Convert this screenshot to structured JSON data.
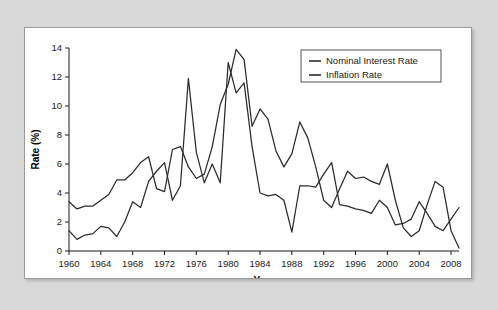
{
  "panel": {
    "background_color": "#ffffff",
    "border_color": "#9a9a9a",
    "page_background_color": "#d9d9d9"
  },
  "legend": {
    "position": "top-right",
    "items": [
      {
        "label": "Nominal Interest Rate",
        "color": "#2b2b2b"
      },
      {
        "label": "Inflation Rate",
        "color": "#2b2b2b"
      }
    ]
  },
  "axes": {
    "x_title": "Year",
    "y_title": "Rate (%)",
    "x_ticks": [
      "1960",
      "1964",
      "1968",
      "1972",
      "1976",
      "1980",
      "1984",
      "1988",
      "1992",
      "1996",
      "2000",
      "2004",
      "2008"
    ],
    "y_ticks": [
      "0",
      "2",
      "4",
      "6",
      "8",
      "10",
      "12",
      "14"
    ]
  },
  "chart_data": {
    "type": "line",
    "title": "",
    "subtitle": "",
    "xlabel": "Year",
    "ylabel": "Rate (%)",
    "xlim": [
      1960,
      2009
    ],
    "ylim": [
      0,
      14
    ],
    "grid": false,
    "legend_position": "top-right",
    "x_tick_step": 4,
    "y_tick_step": 2,
    "x": [
      1960,
      1961,
      1962,
      1963,
      1964,
      1965,
      1966,
      1967,
      1968,
      1969,
      1970,
      1971,
      1972,
      1973,
      1974,
      1975,
      1976,
      1977,
      1978,
      1979,
      1980,
      1981,
      1982,
      1983,
      1984,
      1985,
      1986,
      1987,
      1988,
      1989,
      1990,
      1991,
      1992,
      1993,
      1994,
      1995,
      1996,
      1997,
      1998,
      1999,
      2000,
      2001,
      2002,
      2003,
      2004,
      2005,
      2006,
      2007,
      2008,
      2009
    ],
    "series": [
      {
        "name": "Nominal Interest Rate",
        "color": "#2b2b2b",
        "values": [
          3.4,
          2.9,
          3.1,
          3.1,
          3.5,
          3.9,
          4.9,
          4.9,
          5.4,
          6.1,
          6.5,
          4.3,
          4.1,
          7.0,
          7.2,
          5.8,
          5.0,
          5.3,
          7.2,
          10.1,
          11.5,
          13.9,
          13.2,
          8.6,
          9.8,
          9.1,
          6.9,
          5.8,
          6.7,
          8.9,
          7.8,
          5.8,
          3.5,
          3.0,
          4.3,
          5.5,
          5.0,
          5.1,
          4.8,
          4.6,
          6.0,
          3.5,
          1.6,
          1.0,
          1.4,
          3.2,
          4.8,
          4.4,
          1.4,
          0.2
        ]
      },
      {
        "name": "Inflation Rate",
        "color": "#2b2b2b",
        "values": [
          1.4,
          0.8,
          1.1,
          1.2,
          1.7,
          1.6,
          1.0,
          2.0,
          3.4,
          3.0,
          4.8,
          5.5,
          6.1,
          3.5,
          4.5,
          11.9,
          6.8,
          4.7,
          6.0,
          4.7,
          13.0,
          10.9,
          11.6,
          7.2,
          4.0,
          3.8,
          3.9,
          3.5,
          1.3,
          4.5,
          4.5,
          4.4,
          5.3,
          6.1,
          3.2,
          3.1,
          2.9,
          2.8,
          2.6,
          3.5,
          3.0,
          1.8,
          1.9,
          2.2,
          3.4,
          2.6,
          1.7,
          1.4,
          2.2,
          3.0
        ]
      }
    ]
  }
}
